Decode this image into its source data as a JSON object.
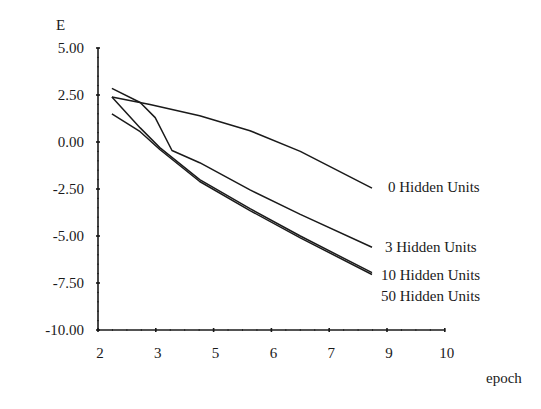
{
  "chart_data": {
    "type": "line",
    "title": "",
    "ylabel": "E",
    "xlabel": "epoch",
    "ylim": [
      -10.0,
      5.0
    ],
    "yticks": [
      "5.00",
      "2.50",
      "0.00",
      "-2.50",
      "-5.00",
      "-7.50",
      "-10.00"
    ],
    "ytick_values": [
      5.0,
      2.5,
      0.0,
      -2.5,
      -5.0,
      -7.5,
      -10.0
    ],
    "xticks": [
      "2",
      "3",
      "5",
      "6",
      "7",
      "9",
      "10"
    ],
    "x_note": "x values are positions along the evenly spaced tick axis (0 = '2', 6 = '10')",
    "grid": false,
    "legend_position": "inline-right",
    "series": [
      {
        "name": "0 Hidden Units",
        "x": [
          0.24,
          0.9,
          1.76,
          2.63,
          3.5,
          4.74
        ],
        "values": [
          2.4,
          2.0,
          1.4,
          0.6,
          -0.5,
          -2.45
        ]
      },
      {
        "name": "3 Hidden Units",
        "x": [
          0.24,
          0.73,
          0.99,
          1.28,
          1.76,
          2.63,
          3.5,
          4.74
        ],
        "values": [
          2.85,
          2.1,
          1.3,
          -0.45,
          -1.1,
          -2.55,
          -3.85,
          -5.6
        ]
      },
      {
        "name": "10 Hidden Units",
        "x": [
          0.24,
          0.73,
          1.07,
          1.76,
          2.63,
          3.5,
          4.74
        ],
        "values": [
          2.4,
          0.75,
          -0.3,
          -2.0,
          -3.55,
          -5.0,
          -6.95
        ]
      },
      {
        "name": "50 Hidden Units",
        "x": [
          0.24,
          0.73,
          1.07,
          1.76,
          2.63,
          3.5,
          4.74
        ],
        "values": [
          1.5,
          0.55,
          -0.4,
          -2.1,
          -3.65,
          -5.1,
          -7.05
        ]
      }
    ],
    "label_positions": [
      {
        "name": "0 Hidden Units",
        "value": -2.4
      },
      {
        "name": "3 Hidden Units",
        "value": -5.6
      },
      {
        "name": "10 Hidden Units",
        "value": -7.05
      },
      {
        "name": "50 Hidden Units",
        "value": -8.2
      }
    ]
  }
}
